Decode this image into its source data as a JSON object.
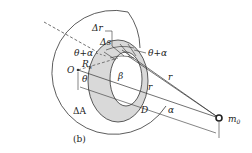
{
  "figure": {
    "caption": "(b)",
    "labels": {
      "delta_r": "Δr",
      "delta_s": "Δs",
      "theta_plus_alpha_left": "θ+α",
      "theta_plus_alpha_right": "θ+α",
      "origin": "O",
      "radius": "R",
      "radius_sub": "s",
      "theta": "θ",
      "beta": "β",
      "r_upper": "r",
      "r_lower": "r",
      "delta_A": "ΔA",
      "distance": "D",
      "alpha": "α",
      "mass": "m",
      "mass_sub": "0"
    },
    "colors": {
      "line": "#333333",
      "ring_fill": "#d9d9d9",
      "background": "#ffffff"
    }
  }
}
